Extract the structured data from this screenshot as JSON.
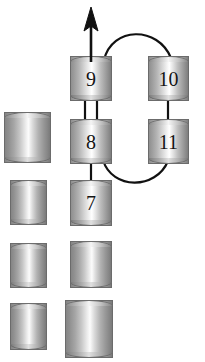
{
  "figure": {
    "background_color": "#ffffff",
    "width": 205,
    "height": 362
  },
  "style": {
    "node_outline_color": "#6b6b6b",
    "bond_color": "#111111",
    "label_color": "#141414",
    "bond_width": 2.0
  },
  "nodes": [
    {
      "id": "node-9",
      "label": "9",
      "x": 70,
      "y": 56,
      "w": 42,
      "h": 45,
      "labeled": true
    },
    {
      "id": "node-10",
      "label": "10",
      "x": 148,
      "y": 56,
      "w": 41,
      "h": 45,
      "labeled": true
    },
    {
      "id": "node-8",
      "label": "8",
      "x": 70,
      "y": 119,
      "w": 42,
      "h": 45,
      "labeled": true
    },
    {
      "id": "node-11",
      "label": "11",
      "x": 148,
      "y": 119,
      "w": 41,
      "h": 45,
      "labeled": true
    },
    {
      "id": "node-7",
      "label": "7",
      "x": 70,
      "y": 180,
      "w": 42,
      "h": 46,
      "labeled": true
    },
    {
      "id": "blank-a",
      "label": "",
      "x": 4,
      "y": 112,
      "w": 47,
      "h": 51,
      "labeled": false
    },
    {
      "id": "blank-b",
      "label": "",
      "x": 10,
      "y": 180,
      "w": 37,
      "h": 45,
      "labeled": false
    },
    {
      "id": "blank-c",
      "label": "",
      "x": 10,
      "y": 243,
      "w": 37,
      "h": 45,
      "labeled": false
    },
    {
      "id": "blank-d",
      "label": "",
      "x": 70,
      "y": 241,
      "w": 42,
      "h": 47,
      "labeled": false
    },
    {
      "id": "blank-e",
      "label": "",
      "x": 10,
      "y": 303,
      "w": 37,
      "h": 47,
      "labeled": false
    },
    {
      "id": "blank-f",
      "label": "",
      "x": 65,
      "y": 300,
      "w": 48,
      "h": 58,
      "labeled": false
    }
  ],
  "bonds": [
    {
      "id": "bond-9-8",
      "from": "9",
      "to": "8",
      "kind": "double",
      "shape": "straight"
    },
    {
      "id": "bond-8-7",
      "from": "8",
      "to": "7",
      "kind": "single",
      "shape": "straight"
    },
    {
      "id": "bond-10-11",
      "from": "10",
      "to": "11",
      "kind": "single",
      "shape": "straight"
    },
    {
      "id": "bond-9-10",
      "from": "9",
      "to": "10",
      "kind": "single",
      "shape": "arc-over"
    },
    {
      "id": "bond-8-11",
      "from": "8",
      "to": "11",
      "kind": "single",
      "shape": "arc-under"
    }
  ],
  "arrow": {
    "id": "growth-arrow",
    "from_node": "9",
    "direction": "up",
    "tail_x": 91,
    "tail_y": 56,
    "head_y": 8,
    "label": ""
  }
}
